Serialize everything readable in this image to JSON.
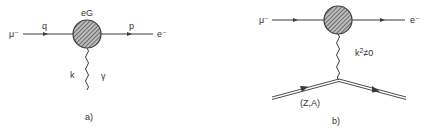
{
  "colors": {
    "ink": "#3a3a3a",
    "background": "#ffffff"
  },
  "diagram_a": {
    "caption": "a)",
    "incoming_particle": "μ⁻",
    "incoming_momentum": "q",
    "vertex_label": "eG",
    "outgoing_momentum": "p",
    "outgoing_particle": "e⁻",
    "photon_momentum": "k",
    "photon_label": "γ"
  },
  "diagram_b": {
    "caption": "b)",
    "incoming_particle": "μ⁻",
    "outgoing_particle": "e⁻",
    "photon_condition_base": "k",
    "photon_condition_exp": "2",
    "photon_condition_rest": "≠0",
    "nucleus_label": "(Z,A)"
  }
}
